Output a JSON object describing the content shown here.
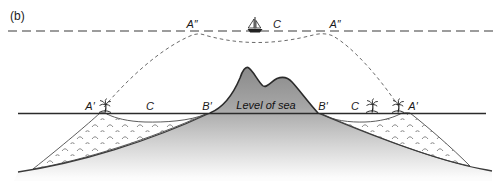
{
  "figure": {
    "type": "cross-section-diagram",
    "panel_label": "(b)",
    "upper_zone": {
      "a_double_prime_left": "A″",
      "c_upper": "C",
      "a_double_prime_right": "A″",
      "icon": "sailboat-icon",
      "dashed_line_meaning": "future (raised) sea level"
    },
    "sea_level_zone": {
      "a_prime_left": "A′",
      "c_left": "C",
      "b_prime_left": "B′",
      "level_of_sea": "Level of sea",
      "b_prime_right": "B′",
      "c_right": "C",
      "a_prime_right": "A′",
      "palm_tree_count": 3
    },
    "colors": {
      "background": "#ffffff",
      "volcano_top_gray": "#858585",
      "volcano_fade_bottom": "#fcfcfc",
      "sea_level_line": "#2b2b2b",
      "upper_dashed_line": "#9c9c9c",
      "profile_dashed_curve": "#6a6a6a",
      "reef_fill": "#ffffff",
      "reef_outline": "#4a4a4a",
      "stipple_marks": "#7d7d7d",
      "label_text": "#1a1a1a"
    }
  }
}
